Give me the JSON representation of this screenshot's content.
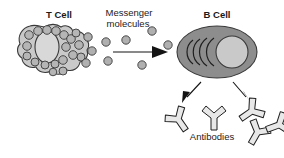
{
  "figure": {
    "type": "biology-diagram",
    "title_text": "",
    "background_color": "#ffffff",
    "width": 284,
    "height": 158
  },
  "labels": {
    "t_cell": "T Cell",
    "messenger_line1": "Messenger",
    "messenger_line2": "molecules",
    "b_cell": "B Cell",
    "antibodies": "Antibodies"
  },
  "colors": {
    "outline": "#3a3a3a",
    "t_cell_fill": "#c9c9c9",
    "t_cell_nucleus": "#d6d6d6",
    "vesicle_fill": "#b5b5b5",
    "molecule_fill": "#b0b0b0",
    "b_cell_fill": "#8d8d8d",
    "b_cell_nucleus": "#c9c9c9",
    "antibody_fill": "#e8e8e8",
    "arrow": "#141414",
    "text": "#1a1a1a"
  },
  "elements": {
    "t_cell": {
      "name": "T Cell",
      "description": "amoeboid cell with lobed membrane, oval nucleus and internal vesicles",
      "vesicle_count": 24
    },
    "messenger_molecules": {
      "name": "Messenger molecules",
      "description": "small gray circles released between the cells",
      "count": 9
    },
    "transfer_arrow": {
      "name": "transfer-arrow",
      "direction": "right",
      "from": "T Cell",
      "to": "B Cell"
    },
    "b_cell": {
      "name": "B Cell",
      "description": "dark ellipse with light round nucleus and crescent endoplasmic reticulum",
      "crescent_count": 4
    },
    "production_arrows": {
      "name": "production-arrows",
      "count": 2,
      "direction": "down"
    },
    "antibodies": {
      "name": "Antibodies",
      "description": "Y-shaped immunoglobulin outlines",
      "count": 5
    }
  }
}
